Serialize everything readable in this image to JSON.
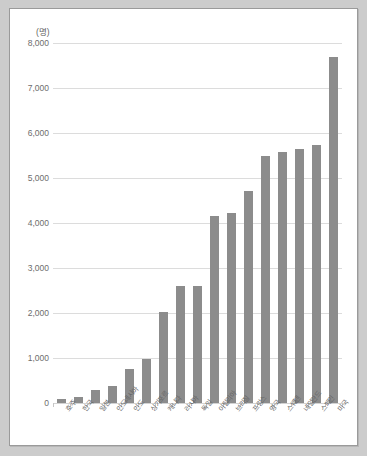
{
  "chart_data": {
    "type": "bar",
    "title": "",
    "subtitle": "",
    "unit_label": "(명)",
    "xlabel": "",
    "ylabel": "",
    "ylim": [
      0,
      8000
    ],
    "ytick_values": [
      8000,
      7000,
      6000,
      5000,
      4000,
      3000,
      2000,
      1000,
      0
    ],
    "ytick_labels": [
      "8,000",
      "7,000",
      "6,000",
      "5,000",
      "4,000",
      "3,000",
      "2,000",
      "1,000",
      "0"
    ],
    "grid": true,
    "legend": "none",
    "bar_color": "#8c8c8c",
    "gridline_color": "#dcdcdc",
    "categories": [
      "호주",
      "한국",
      "일본",
      "인도네시아",
      "인도",
      "싱가포르",
      "캐나다",
      "러시아",
      "독일",
      "이탈리아",
      "브라질",
      "프랑스",
      "영국",
      "스웨덴",
      "네덜란드",
      "스페인",
      "미국"
    ],
    "values": [
      90,
      130,
      290,
      370,
      760,
      980,
      2020,
      2590,
      2610,
      4150,
      4230,
      4720,
      5480,
      5580,
      5640,
      5730,
      7680
    ],
    "series": [
      {
        "name": "인원",
        "values": [
          90,
          130,
          290,
          370,
          760,
          980,
          2020,
          2590,
          2610,
          4150,
          4230,
          4720,
          5480,
          5580,
          5640,
          5730,
          7680
        ]
      }
    ]
  },
  "frame": {
    "background_color": "#cccccc",
    "card_background": "#ffffff",
    "card_border": "#9a9a9a"
  }
}
